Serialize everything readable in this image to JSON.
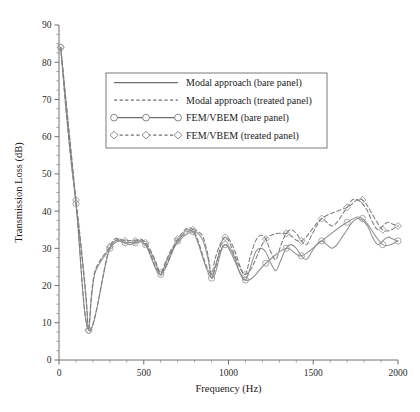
{
  "chart_data": {
    "type": "line",
    "title": "",
    "xlabel": "Frequency (Hz)",
    "ylabel": "Transmission Loss (dB)",
    "xlim": [
      0,
      2000
    ],
    "ylim": [
      0,
      90
    ],
    "grid": false,
    "legend_position": "upper-center",
    "x_ticks": [
      0,
      500,
      1000,
      1500,
      2000
    ],
    "x_tick_labels": [
      "0",
      "500",
      "1000",
      "1500",
      "2000"
    ],
    "x_minor_step": 100,
    "y_ticks": [
      0,
      10,
      20,
      30,
      40,
      50,
      60,
      70,
      80,
      90
    ],
    "y_tick_labels": [
      "0",
      "10",
      "20",
      "30",
      "40",
      "50",
      "60",
      "70",
      "80",
      "90"
    ],
    "y_minor_step": 2.5,
    "colors": {
      "solid_line": "#8f8f8f",
      "dashed_line": "#7d7d7d",
      "axis": "#6e6e6e",
      "text": "#1a1a1a",
      "legend_border": "#7a7a7a",
      "background": "#ffffff"
    },
    "series": [
      {
        "name": "Modal approach (bare panel)",
        "style": "solid",
        "marker": "none",
        "x": [
          10,
          40,
          70,
          100,
          130,
          160,
          175,
          190,
          210,
          240,
          270,
          300,
          330,
          360,
          390,
          420,
          450,
          480,
          510,
          540,
          570,
          600,
          630,
          660,
          690,
          710,
          730,
          760,
          790,
          820,
          850,
          880,
          900,
          920,
          950,
          980,
          1010,
          1040,
          1070,
          1100,
          1130,
          1160,
          1190,
          1220,
          1250,
          1280,
          1310,
          1340,
          1370,
          1400,
          1430,
          1460,
          1490,
          1520,
          1550,
          1580,
          1610,
          1640,
          1670,
          1700,
          1730,
          1760,
          1790,
          1820,
          1850,
          1880,
          1910,
          1940,
          1970,
          2000
        ],
        "y": [
          84,
          68,
          54,
          42,
          30,
          16,
          8,
          16,
          23,
          26,
          28,
          30,
          31.5,
          32,
          31.5,
          31,
          31.5,
          32,
          31,
          29,
          26,
          23,
          26,
          29,
          31,
          32,
          33,
          34,
          34.5,
          34,
          32,
          27,
          22,
          25,
          29,
          31,
          30,
          27,
          23,
          21.5,
          25,
          29,
          30,
          29,
          26,
          24,
          27,
          30,
          31,
          30,
          28,
          27,
          29,
          31,
          32,
          31,
          30,
          31,
          33,
          35,
          37,
          38,
          37.5,
          36,
          33,
          31,
          32,
          33,
          32.5,
          32
        ]
      },
      {
        "name": "Modal approach (treated panel)",
        "style": "dashed",
        "marker": "none",
        "x": [
          10,
          40,
          70,
          100,
          130,
          160,
          175,
          190,
          210,
          240,
          270,
          300,
          330,
          360,
          390,
          420,
          450,
          480,
          510,
          540,
          570,
          600,
          630,
          660,
          690,
          710,
          730,
          760,
          790,
          820,
          850,
          880,
          900,
          920,
          950,
          980,
          1010,
          1040,
          1070,
          1100,
          1130,
          1160,
          1190,
          1220,
          1250,
          1280,
          1310,
          1340,
          1370,
          1400,
          1430,
          1460,
          1490,
          1520,
          1550,
          1580,
          1610,
          1640,
          1670,
          1700,
          1730,
          1760,
          1790,
          1820,
          1850,
          1880,
          1910,
          1940,
          1970,
          2000
        ],
        "y": [
          84,
          68,
          54,
          43,
          31,
          17,
          8,
          17,
          23.5,
          26.5,
          28.5,
          30.5,
          32,
          32.5,
          32,
          31.5,
          32,
          32.5,
          31.5,
          29.5,
          26.5,
          23.5,
          26.5,
          29.5,
          31.5,
          32.5,
          33.5,
          34.5,
          35,
          34.5,
          33,
          28,
          23,
          27,
          31,
          33,
          32,
          29,
          25,
          23,
          28,
          32,
          33.5,
          32.5,
          29,
          27,
          31,
          34,
          35,
          34,
          32,
          31,
          33.5,
          36,
          38,
          37,
          36,
          37,
          39,
          41,
          43,
          43,
          42,
          40,
          37,
          35,
          36,
          37,
          36.5,
          36
        ]
      },
      {
        "name": "FEM/VBEM (bare panel)",
        "style": "solid",
        "marker": "circle",
        "x": [
          10,
          100,
          175,
          300,
          390,
          450,
          510,
          600,
          700,
          790,
          900,
          980,
          1100,
          1220,
          1340,
          1430,
          1550,
          1700,
          1790,
          1910,
          2000
        ],
        "y": [
          84,
          42,
          8,
          30,
          31.5,
          31.5,
          31,
          23,
          32,
          34.5,
          22,
          31,
          21.5,
          26,
          30,
          28,
          32,
          37,
          38,
          31,
          32
        ]
      },
      {
        "name": "FEM/VBEM (treated panel)",
        "style": "dashed",
        "marker": "diamond",
        "x": [
          10,
          100,
          175,
          300,
          390,
          450,
          510,
          600,
          700,
          790,
          900,
          980,
          1100,
          1220,
          1340,
          1430,
          1550,
          1700,
          1790,
          1910,
          2000
        ],
        "y": [
          84,
          43,
          8,
          30.5,
          32,
          32,
          31.5,
          23.5,
          32.5,
          35,
          23,
          33,
          23,
          32.5,
          34,
          32,
          38,
          41,
          43,
          35,
          36
        ]
      }
    ]
  },
  "legend": {
    "entries": [
      {
        "label": "Modal approach (bare panel)",
        "style": "solid",
        "marker": "none"
      },
      {
        "label": "Modal approach (treated panel)",
        "style": "dashed",
        "marker": "none"
      },
      {
        "label": "FEM/VBEM (bare panel)",
        "style": "solid",
        "marker": "circle"
      },
      {
        "label": "FEM/VBEM (treated panel)",
        "style": "dashed",
        "marker": "diamond"
      }
    ]
  },
  "axes": {
    "x_title": "Frequency (Hz)",
    "y_title": "Transmission Loss (dB)"
  }
}
